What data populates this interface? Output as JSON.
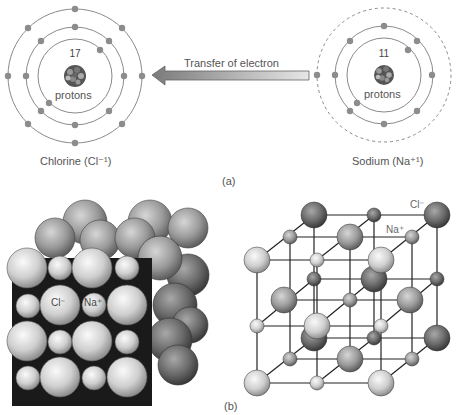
{
  "part_a": {
    "label": "(a)",
    "chlorine": {
      "protons_count": "17",
      "protons_label": "protons",
      "name": "Chlorine (Cl⁻¹)",
      "shells": [
        2,
        8,
        8
      ]
    },
    "sodium": {
      "protons_count": "11",
      "protons_label": "protons",
      "name": "Sodium (Na⁺¹)",
      "shells": [
        2,
        8,
        1
      ],
      "outer_shell_dashed": true
    },
    "arrow_label": "Transfer of electron"
  },
  "part_b": {
    "label": "(b)",
    "space_filling": {
      "cl_label": "Cl⁻",
      "na_label": "Na⁺"
    },
    "lattice": {
      "cl_label": "Cl⁻",
      "na_label": "Na⁺"
    }
  },
  "colors": {
    "shell": "#8a8a8a",
    "electron": "#8c8c8c",
    "light_sphere": "#d8d8d8",
    "dark_sphere": "#6a6a6a"
  }
}
